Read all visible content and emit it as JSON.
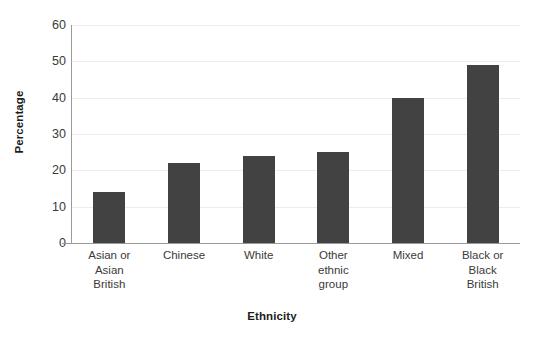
{
  "chart_data": {
    "type": "bar",
    "title": "",
    "subtitle": "",
    "xlabel": "Ethnicity",
    "ylabel": "Percentage",
    "categories": [
      "Asian or\nAsian\nBritish",
      "Chinese",
      "White",
      "Other\nethnic\ngroup",
      "Mixed",
      "Black or\nBlack\nBritish"
    ],
    "values": [
      14,
      22,
      24,
      25,
      40,
      49
    ],
    "ylim": [
      0,
      60
    ],
    "yticks": [
      0,
      10,
      20,
      30,
      40,
      50,
      60
    ],
    "ytick_labels": [
      "0",
      "10",
      "20",
      "30",
      "40",
      "50",
      "60"
    ],
    "grid": true,
    "legend": "none",
    "bar_color": "#424242",
    "gridline_color": "#ececec",
    "axis_color": "#9a9a9a",
    "text_color": "#3a3a3a"
  },
  "axis": {
    "x_title": "Ethnicity",
    "y_title": "Percentage"
  }
}
